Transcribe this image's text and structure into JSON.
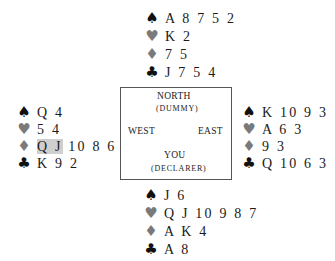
{
  "suits": {
    "spades": "♠",
    "hearts": "♥",
    "diamonds": "♦",
    "clubs": "♣"
  },
  "colors": {
    "black_suit": "#111111",
    "red_suit": "#7a7a7a",
    "highlight": "#cfcfcf",
    "border": "#555555"
  },
  "table": {
    "north": "NORTH",
    "north_role": "(DUMMY)",
    "west": "WEST",
    "east": "EAST",
    "south": "YOU",
    "south_role": "(DECLARER)"
  },
  "hands": {
    "north": {
      "spades": "A 8 7 5 2",
      "hearts": "K 2",
      "diamonds": "7 5",
      "clubs": "J 7 5 4"
    },
    "west": {
      "spades": "Q 4",
      "hearts": "5 4",
      "diamonds_highlight": "Q J",
      "diamonds_rest": " 10 8 6 2",
      "clubs": "K 9 2"
    },
    "east": {
      "spades": "K 10 9 3",
      "hearts": "A 6 3",
      "diamonds": "9 3",
      "clubs": "Q 10 6 3"
    },
    "south": {
      "spades": "J 6",
      "hearts": "Q J 10 9 8 7",
      "diamonds": "A K 4",
      "clubs": "A 8"
    }
  }
}
